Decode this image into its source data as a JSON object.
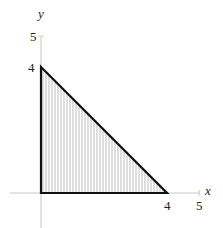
{
  "diagram": {
    "type": "shaded-region-triangle",
    "x_axis_label": "x",
    "y_axis_label": "y",
    "x_ticks": [
      {
        "value": 4,
        "label": "4"
      },
      {
        "value": 5,
        "label": "5"
      }
    ],
    "y_ticks": [
      {
        "value": 4,
        "label": "4"
      },
      {
        "value": 5,
        "label": "5"
      }
    ],
    "vertices": [
      [
        0,
        0
      ],
      [
        4,
        0
      ],
      [
        0,
        4
      ]
    ],
    "fill": "vertical hatching",
    "colors": {
      "outline": "#111111",
      "axis": "#bbbbbb",
      "hatch": "#999999"
    }
  }
}
